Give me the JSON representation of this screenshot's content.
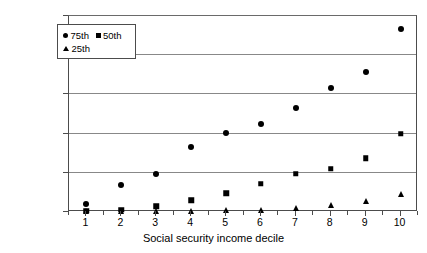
{
  "chart_data": {
    "type": "scatter",
    "title": "",
    "xlabel": "Social security income decile",
    "ylabel": "",
    "categories": [
      "1",
      "2",
      "3",
      "4",
      "5",
      "6",
      "7",
      "8",
      "9",
      "10"
    ],
    "x": [
      1,
      2,
      3,
      4,
      5,
      6,
      7,
      8,
      9,
      10
    ],
    "ytick_labels": [
      "$20,000",
      "$16,000",
      "$16,000",
      "$8,000",
      "$4,000",
      "$0"
    ],
    "ytick_values": [
      20000,
      16000,
      12000,
      8000,
      4000,
      0
    ],
    "ylim": [
      0,
      20000
    ],
    "xlim": [
      0.5,
      10.5
    ],
    "grid": true,
    "legend_position": "top-left",
    "series": [
      {
        "name": "75th",
        "marker": "circle",
        "values": [
          800,
          2800,
          3900,
          6600,
          8100,
          9000,
          10600,
          12700,
          14300,
          18700
        ]
      },
      {
        "name": "50th",
        "marker": "square",
        "values": [
          150,
          250,
          600,
          1200,
          1900,
          2900,
          3900,
          4400,
          5500,
          8000
        ]
      },
      {
        "name": "25th",
        "marker": "triangle",
        "values": [
          80,
          100,
          120,
          150,
          170,
          200,
          400,
          700,
          1100,
          1800
        ]
      }
    ]
  },
  "axis": {
    "x_title": "Social security income decile"
  },
  "legend": {
    "entries": [
      {
        "label": "75th",
        "marker": "circle"
      },
      {
        "label": "50th",
        "marker": "square"
      },
      {
        "label": "25th",
        "marker": "triangle"
      }
    ]
  }
}
